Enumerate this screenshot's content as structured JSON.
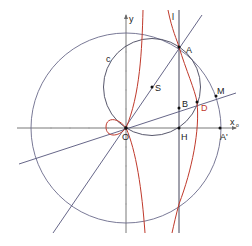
{
  "figure": {
    "title": "",
    "colors": {
      "lines": "#55557a",
      "axes": "#6a6a6a",
      "curve": "#c0392b",
      "points": "#111111"
    },
    "axes": {
      "x_label": "x",
      "y_label": "y",
      "origin": {
        "x": 126,
        "y": 128
      },
      "x_range_px": [
        17,
        236
      ],
      "y_range_px": [
        15,
        233
      ]
    },
    "points": [
      {
        "name": "O",
        "label": "O",
        "x": 126,
        "y": 128
      },
      {
        "name": "A",
        "label": "A",
        "x": 179,
        "y": 47
      },
      {
        "name": "S",
        "label": "S",
        "x": 152,
        "y": 87
      },
      {
        "name": "B",
        "label": "B",
        "x": 179,
        "y": 108
      },
      {
        "name": "D",
        "label": "D",
        "x": 197,
        "y": 102
      },
      {
        "name": "M",
        "label": "M",
        "x": 216,
        "y": 96
      },
      {
        "name": "H",
        "label": "H",
        "x": 179,
        "y": 128
      },
      {
        "name": "A'",
        "label": "A'",
        "x": 220,
        "y": 128
      }
    ],
    "circles": [
      {
        "name": "big-circle",
        "cx": 126,
        "cy": 128,
        "r": 95
      },
      {
        "name": "circle-c",
        "label": "c",
        "cx": 152,
        "cy": 87,
        "r": 48.5
      }
    ],
    "lines": [
      {
        "name": "line-l",
        "label": "l",
        "x1": 179,
        "y1": 10,
        "x2": 179,
        "y2": 233
      },
      {
        "name": "line-OA",
        "x1": 53,
        "y1": 233,
        "x2": 202,
        "y2": 15
      },
      {
        "name": "line-OM",
        "x1": 19,
        "y1": 164,
        "x2": 236,
        "y2": 93
      }
    ],
    "labels": {
      "c": "c",
      "l": "l",
      "x_sub": "o"
    }
  }
}
